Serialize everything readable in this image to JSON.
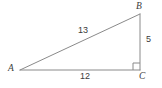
{
  "figure": {
    "type": "right-triangle-diagram",
    "canvas": {
      "width": 162,
      "height": 88,
      "background": "#ffffff"
    },
    "style": {
      "stroke_color": "#8a8a8a",
      "stroke_width": 1,
      "text_color": "#3b3b3b"
    },
    "vertices": [
      {
        "id": "A",
        "label": "A",
        "x": 20,
        "y": 70,
        "label_x": 8,
        "label_y": 64
      },
      {
        "id": "B",
        "label": "B",
        "x": 140,
        "y": 14,
        "label_x": 136,
        "label_y": 2
      },
      {
        "id": "C",
        "label": "C",
        "x": 140,
        "y": 70,
        "label_x": 139,
        "label_y": 72
      }
    ],
    "sides": [
      {
        "id": "AB",
        "name": "hypotenuse",
        "label": "13",
        "label_x": 78,
        "label_y": 26
      },
      {
        "id": "BC",
        "name": "vertical-leg",
        "label": "5",
        "label_x": 146,
        "label_y": 35
      },
      {
        "id": "AC",
        "name": "base-leg",
        "label": "12",
        "label_x": 80,
        "label_y": 72
      }
    ],
    "right_angle": {
      "at_vertex": "C",
      "marker": "square",
      "size": 7
    }
  }
}
